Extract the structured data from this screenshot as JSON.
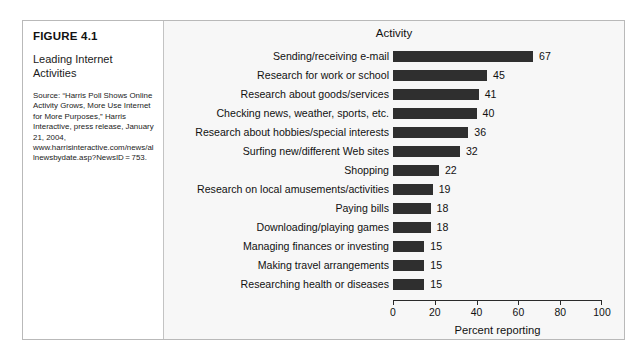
{
  "figure": {
    "number": "FIGURE 4.1",
    "subtitle": "Leading Internet Activities",
    "source": "Source: “Harris Poll Shows Online Activity Grows, More Use Internet for More Purposes,” Harris Interactive, press release, January 21, 2004, www.harrisinteractive.com/news/allnewsbydate.asp?NewsID = 753."
  },
  "chart_data": {
    "type": "bar",
    "orientation": "horizontal",
    "title": "Activity",
    "xlabel": "Percent reporting",
    "ylabel": "",
    "xlim": [
      0,
      100
    ],
    "xticks": [
      0,
      20,
      40,
      60,
      80,
      100
    ],
    "grid": false,
    "legend": false,
    "bar_color": "#2f2f2f",
    "categories": [
      "Sending/receiving e-mail",
      "Research for work or school",
      "Research about goods/services",
      "Checking news, weather, sports, etc.",
      "Research about hobbies/special interests",
      "Surfing new/different Web sites",
      "Shopping",
      "Research on local amusements/activities",
      "Paying bills",
      "Downloading/playing games",
      "Managing finances or investing",
      "Making travel arrangements",
      "Researching health or diseases"
    ],
    "values": [
      67,
      45,
      41,
      40,
      36,
      32,
      22,
      19,
      18,
      18,
      15,
      15,
      15
    ]
  }
}
